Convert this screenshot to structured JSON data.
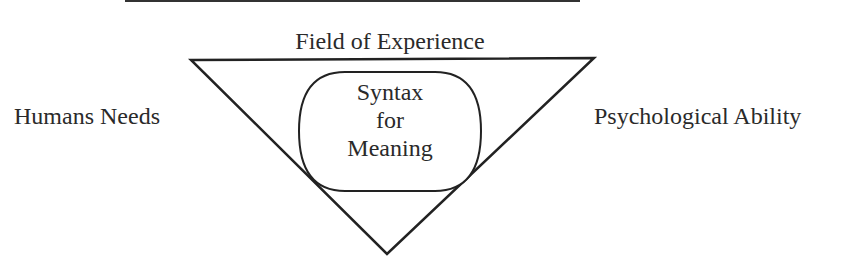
{
  "diagram": {
    "title": "Field of Experience",
    "left_label": "Humans Needs",
    "right_label": "Psychological Ability",
    "center": {
      "lines": [
        "Syntax",
        "for",
        "Meaning"
      ]
    },
    "shapes": {
      "triangle": "inverted",
      "center_shape": "rounded-rectangle"
    },
    "colors": {
      "stroke": "#222222",
      "background": "#ffffff"
    }
  }
}
